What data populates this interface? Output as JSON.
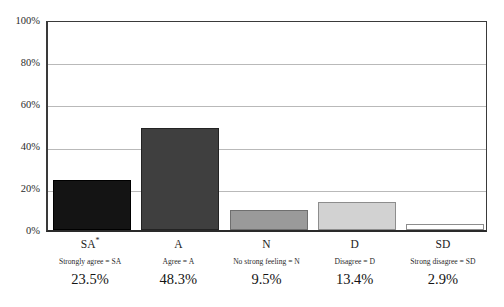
{
  "chart_data": {
    "type": "bar",
    "title": "",
    "xlabel": "",
    "ylabel": "",
    "ylim": [
      0,
      100
    ],
    "grid": true,
    "legend_position": "below-axis",
    "categories": [
      "SA",
      "A",
      "N",
      "D",
      "SD"
    ],
    "values": [
      23.5,
      48.3,
      9.5,
      13.4,
      2.9
    ],
    "y_ticks": [
      0,
      20,
      40,
      60,
      80,
      100
    ],
    "y_tick_labels": [
      "0%",
      "20%",
      "40%",
      "60%",
      "80%",
      "100%"
    ],
    "series": [
      {
        "name": "Response share",
        "values": [
          23.5,
          48.3,
          9.5,
          13.4,
          2.9
        ]
      }
    ],
    "bars": [
      {
        "code": "SA",
        "footnote_marker": "*",
        "legend": "Strongly agree = SA",
        "value": 23.5,
        "value_label": "23.5%",
        "fill": "#141414",
        "stroke": "#000000"
      },
      {
        "code": "A",
        "footnote_marker": "",
        "legend": "Agree = A",
        "value": 48.3,
        "value_label": "48.3%",
        "fill": "#3f3f3f",
        "stroke": "#232323"
      },
      {
        "code": "N",
        "footnote_marker": "",
        "legend": "No strong feeling = N",
        "value": 9.5,
        "value_label": "9.5%",
        "fill": "#9a9a9a",
        "stroke": "#6f6f6f"
      },
      {
        "code": "D",
        "footnote_marker": "",
        "legend": "Disagree = D",
        "value": 13.4,
        "value_label": "13.4%",
        "fill": "#d2d2d2",
        "stroke": "#8d8d8d"
      },
      {
        "code": "SD",
        "footnote_marker": "",
        "legend": "Strong disagree = SD",
        "value": 2.9,
        "value_label": "2.9%",
        "fill": "#ffffff",
        "stroke": "#8d8d8d"
      }
    ]
  },
  "axis": {
    "tick_0": "0%",
    "tick_20": "20%",
    "tick_40": "40%",
    "tick_60": "60%",
    "tick_80": "80%",
    "tick_100": "100%"
  },
  "colors": {
    "axis_line": "#3a3a3a",
    "gridline": "#b9b9b9",
    "background": "#ffffff",
    "text": "#1a1a1a"
  }
}
